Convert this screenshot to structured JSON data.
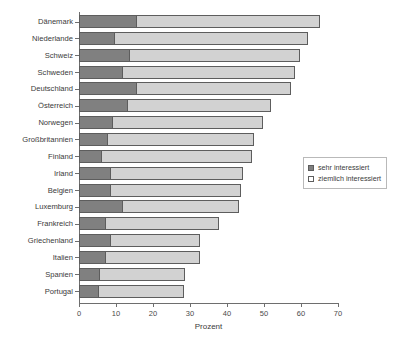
{
  "chart_data": {
    "type": "bar",
    "orientation": "horizontal",
    "stacked": true,
    "title": "",
    "xlabel": "Prozent",
    "ylabel": "",
    "xlim": [
      0,
      70
    ],
    "xticks": [
      0,
      10,
      20,
      30,
      40,
      50,
      60,
      70
    ],
    "grid": false,
    "legend_position": "center-right",
    "categories": [
      "Dänemark",
      "Niederlande",
      "Schweiz",
      "Schweden",
      "Deutschland",
      "Österreich",
      "Norwegen",
      "Großbritannien",
      "Finland",
      "Irland",
      "Belgien",
      "Luxemburg",
      "Frankreich",
      "Griechenland",
      "Italien",
      "Spanien",
      "Portugal"
    ],
    "series": [
      {
        "name": "sehr interessiert",
        "color": "#808080",
        "values": [
          15.5,
          9.5,
          13.5,
          11.5,
          15.5,
          13.0,
          9.0,
          7.5,
          6.0,
          8.5,
          8.5,
          11.5,
          7.0,
          8.5,
          7.0,
          5.5,
          5.0
        ]
      },
      {
        "name": "ziemlich interessiert",
        "color": "#d2d2d2",
        "values": [
          49.5,
          52.0,
          46.0,
          46.5,
          41.5,
          38.5,
          40.5,
          39.5,
          40.5,
          35.5,
          35.0,
          31.5,
          30.5,
          24.0,
          25.5,
          23.0,
          23.0
        ]
      }
    ],
    "totals": [
      65.0,
      61.5,
      59.5,
      58.0,
      57.0,
      51.5,
      49.5,
      47.0,
      46.5,
      44.0,
      43.5,
      43.0,
      37.5,
      32.5,
      32.5,
      28.5,
      28.0
    ]
  },
  "legend": {
    "items": [
      {
        "label": "sehr interessiert",
        "swatch": "filled-gray-swatch"
      },
      {
        "label": "ziemlich interessiert",
        "swatch": "empty-white-swatch"
      }
    ]
  },
  "colors": {
    "series_a": "#808080",
    "series_b": "#d2d2d2",
    "bar_outline": "#5d5d5d",
    "axis": "#6e6e6e",
    "text": "#3a3a3a",
    "background": "#ffffff"
  }
}
